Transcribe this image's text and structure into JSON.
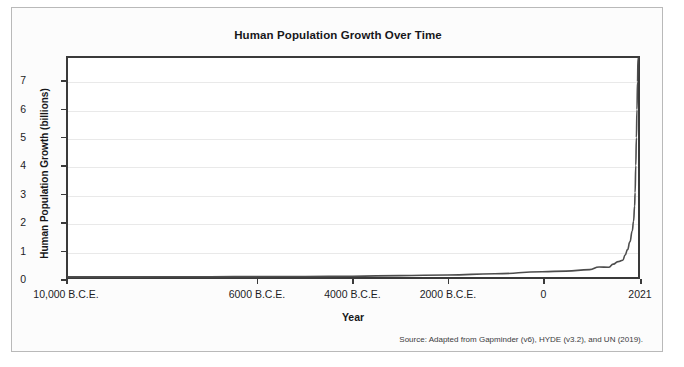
{
  "chart_data": {
    "type": "line",
    "title": "Human Population Growth Over Time",
    "xlabel": "Year",
    "ylabel": "Human Population Growth (billions)",
    "xlim": [
      -10000,
      2021
    ],
    "ylim": [
      0,
      7.85
    ],
    "grid": true,
    "legend": null,
    "source_note": "Source: Adapted from Gapminder (v6), HYDE (v3.2), and UN (2019).",
    "xticks": [
      {
        "value": -10000,
        "label": "10,000 B.C.E."
      },
      {
        "value": -6000,
        "label": "6000 B.C.E."
      },
      {
        "value": -4000,
        "label": "4000 B.C.E."
      },
      {
        "value": -2000,
        "label": "2000 B.C.E."
      },
      {
        "value": 0,
        "label": "0"
      },
      {
        "value": 2021,
        "label": "2021"
      }
    ],
    "yticks": [
      {
        "value": 0,
        "label": "0"
      },
      {
        "value": 1,
        "label": "1"
      },
      {
        "value": 2,
        "label": "2"
      },
      {
        "value": 3,
        "label": "3"
      },
      {
        "value": 4,
        "label": "4"
      },
      {
        "value": 5,
        "label": "5"
      },
      {
        "value": 6,
        "label": "6"
      },
      {
        "value": 7,
        "label": "7"
      }
    ],
    "series": [
      {
        "name": "World population",
        "color": "#4d4d4d",
        "x": [
          -10000,
          -9000,
          -8000,
          -7000,
          -6000,
          -5000,
          -4000,
          -3000,
          -2000,
          -1000,
          0,
          500,
          1000,
          1200,
          1400,
          1500,
          1600,
          1700,
          1750,
          1800,
          1850,
          1900,
          1927,
          1950,
          1960,
          1974,
          1987,
          1999,
          2011,
          2021
        ],
        "y": [
          0.004,
          0.005,
          0.007,
          0.01,
          0.015,
          0.02,
          0.028,
          0.05,
          0.072,
          0.115,
          0.19,
          0.21,
          0.265,
          0.36,
          0.35,
          0.46,
          0.55,
          0.6,
          0.79,
          0.98,
          1.26,
          1.65,
          2.0,
          2.54,
          3.03,
          4.0,
          5.0,
          6.0,
          7.0,
          7.84
        ]
      }
    ]
  }
}
